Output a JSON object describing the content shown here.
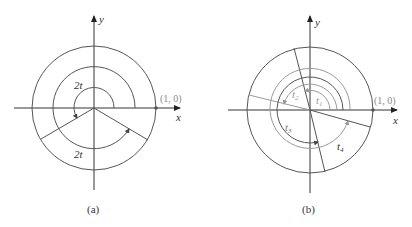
{
  "colors": {
    "dark": "#555555",
    "light": "#9a9a9a",
    "axis": "#333333"
  },
  "panel_a": {
    "caption": "(a)",
    "axis_x_label": "x",
    "axis_y_label": "y",
    "point_label": "(1, 0)",
    "arc_label_upper": "2t",
    "arc_label_lower": "2t"
  },
  "panel_b": {
    "caption": "(b)",
    "axis_x_label": "x",
    "axis_y_label": "y",
    "point_label": "(1, 0)",
    "arc_labels": {
      "t1": "t",
      "t1_sub": "1",
      "t2": "t",
      "t2_sub": "2",
      "t3": "t",
      "t3_sub": "3",
      "t4": "t",
      "t4_sub": "4"
    }
  }
}
